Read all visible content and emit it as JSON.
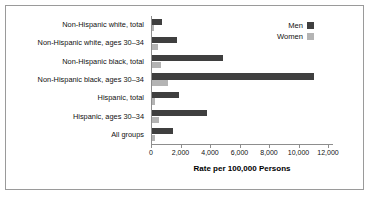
{
  "chart_data": {
    "type": "bar",
    "orientation": "horizontal",
    "title": "",
    "xlabel": "Rate per 100,000 Persons",
    "ylabel": "",
    "xlim": [
      0,
      12000
    ],
    "xticks": [
      0,
      2000,
      4000,
      6000,
      8000,
      10000,
      12000
    ],
    "xtick_labels": [
      "0",
      "2,000",
      "4,000",
      "6,000",
      "8,000",
      "10,000",
      "12,000"
    ],
    "grid": false,
    "legend_position": "top-right",
    "categories": [
      "Non-Hispanic white, total",
      "Non-Hispanic white, ages 30–34",
      "Non-Hispanic black, total",
      "Non-Hispanic black, ages 30–34",
      "Hispanic, total",
      "Hispanic, ages 30–34",
      "All groups"
    ],
    "series": [
      {
        "name": "Men",
        "color": "#3f3f3f",
        "values": [
          700,
          1700,
          4800,
          11000,
          1800,
          3700,
          1400
        ]
      },
      {
        "name": "Women",
        "color": "#b4b4b4",
        "values": [
          120,
          400,
          620,
          1100,
          200,
          450,
          220
        ]
      }
    ]
  },
  "legend": {
    "items": [
      {
        "label": "Men",
        "color": "#3f3f3f"
      },
      {
        "label": "Women",
        "color": "#b4b4b4"
      }
    ]
  },
  "axis": {
    "title": "Rate per 100,000 Persons"
  }
}
